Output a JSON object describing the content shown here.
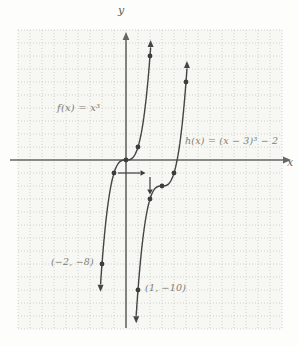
{
  "chart_data": {
    "type": "line",
    "axes": {
      "xlabel": "x",
      "ylabel": "y",
      "x_range_visible": [
        -9,
        13
      ],
      "y_range_visible": [
        -13,
        10
      ],
      "grid": true,
      "grid_step": 1,
      "ticks_labeled": false
    },
    "functions": [
      {
        "name": "f",
        "label": "f(x) = x³",
        "base": "cubic",
        "shift": [
          0,
          0
        ],
        "domain": [
          -2.12,
          2.05
        ],
        "marked_points": [
          [
            -2,
            -8
          ],
          [
            -1,
            -1
          ],
          [
            0,
            0
          ],
          [
            1,
            1
          ],
          [
            2,
            8
          ]
        ],
        "point_label": {
          "text": "(−2, −8)",
          "at": [
            -2,
            -8
          ]
        }
      },
      {
        "name": "h",
        "label": "h(x) = (x − 3)³ − 2",
        "base": "cubic",
        "shift": [
          3,
          -2
        ],
        "domain": [
          0.85,
          5.08
        ],
        "marked_points": [
          [
            1,
            -10
          ],
          [
            2,
            -3
          ],
          [
            3,
            -2
          ],
          [
            4,
            -1
          ],
          [
            5,
            6
          ]
        ],
        "point_label": {
          "text": "(1, −10)",
          "at": [
            1,
            -10
          ]
        }
      }
    ],
    "transformation_arrows": [
      {
        "from": [
          -1,
          -1
        ],
        "to": [
          2,
          -1
        ],
        "direction": "right",
        "meaning": "horizontal shift +3"
      },
      {
        "from": [
          2,
          -1
        ],
        "to": [
          2,
          -3
        ],
        "direction": "down",
        "meaning": "vertical shift −2"
      }
    ],
    "colors": {
      "curve": "#454545",
      "axis": "#666663",
      "grid": "#c9cdc6",
      "dot": "#3d3d3d",
      "label_text": "#807d77",
      "grid_bg": "#f7f7f3"
    }
  }
}
